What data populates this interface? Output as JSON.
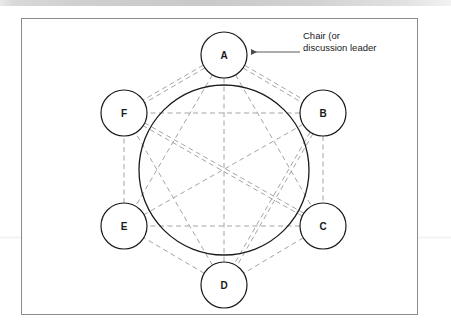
{
  "figure": {
    "frame": {
      "x": 21,
      "y": 18,
      "width": 397,
      "height": 297,
      "border_color": "#8b8b8b"
    },
    "colors": {
      "node_stroke": "#1a1a1a",
      "table_stroke": "#1a1a1a",
      "chord_stroke": "#9a9a9a",
      "annotation_stroke": "#5a5a5a",
      "text": "#1a1a1a",
      "page_background": "#ffffff",
      "top_band": "#cfcfcf"
    },
    "table": {
      "cx": 224,
      "cy": 170,
      "r": 85
    },
    "nodes": [
      {
        "id": "A",
        "label": "A",
        "cx": 224,
        "cy": 55,
        "r": 23
      },
      {
        "id": "B",
        "label": "B",
        "cx": 323,
        "cy": 113,
        "r": 23
      },
      {
        "id": "C",
        "label": "C",
        "cx": 323,
        "cy": 226,
        "r": 23
      },
      {
        "id": "D",
        "label": "D",
        "cx": 224,
        "cy": 285,
        "r": 23
      },
      {
        "id": "E",
        "label": "E",
        "cx": 124,
        "cy": 226,
        "r": 23
      },
      {
        "id": "F",
        "label": "F",
        "cx": 124,
        "cy": 113,
        "r": 23
      }
    ],
    "chords": [
      {
        "from": "A",
        "to": "B",
        "doubled": true
      },
      {
        "from": "A",
        "to": "C",
        "doubled": false
      },
      {
        "from": "A",
        "to": "D",
        "doubled": false
      },
      {
        "from": "A",
        "to": "E",
        "doubled": false
      },
      {
        "from": "A",
        "to": "F",
        "doubled": true
      },
      {
        "from": "B",
        "to": "C",
        "doubled": false
      },
      {
        "from": "B",
        "to": "D",
        "doubled": true
      },
      {
        "from": "B",
        "to": "E",
        "doubled": false
      },
      {
        "from": "B",
        "to": "F",
        "doubled": false
      },
      {
        "from": "C",
        "to": "D",
        "doubled": false
      },
      {
        "from": "C",
        "to": "E",
        "doubled": false
      },
      {
        "from": "C",
        "to": "F",
        "doubled": true
      },
      {
        "from": "D",
        "to": "E",
        "doubled": false
      },
      {
        "from": "D",
        "to": "F",
        "doubled": false
      },
      {
        "from": "E",
        "to": "F",
        "doubled": false
      }
    ],
    "annotation": {
      "line1": "Chair (or",
      "line2": "discussion leader",
      "text_x": 303,
      "text_y": 39,
      "line_height": 12,
      "arrow": {
        "x1": 300,
        "y1": 52,
        "x2": 251,
        "y2": 52,
        "points_to": "A"
      }
    }
  }
}
